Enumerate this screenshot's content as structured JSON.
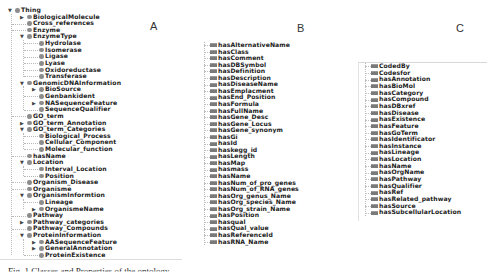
{
  "panel_labels": {
    "a": "A",
    "b": "B",
    "c": "C"
  },
  "class_tree": [
    {
      "label": "Thing",
      "depth": 0,
      "toggle": "expanded"
    },
    {
      "label": "BiologicalMolecule",
      "depth": 1,
      "toggle": "collapsed"
    },
    {
      "label": "Cross_references",
      "depth": 1,
      "toggle": "none"
    },
    {
      "label": "Enzyme",
      "depth": 1,
      "toggle": "none"
    },
    {
      "label": "EnzymeType",
      "depth": 1,
      "toggle": "expanded"
    },
    {
      "label": "Hydrolase",
      "depth": 2,
      "toggle": "none"
    },
    {
      "label": "Isomerase",
      "depth": 2,
      "toggle": "none"
    },
    {
      "label": "Ligase",
      "depth": 2,
      "toggle": "none"
    },
    {
      "label": "Lyase",
      "depth": 2,
      "toggle": "none"
    },
    {
      "label": "Oxidoreductase",
      "depth": 2,
      "toggle": "none"
    },
    {
      "label": "Transferase",
      "depth": 2,
      "toggle": "none"
    },
    {
      "label": "GenomicDNAInformation",
      "depth": 1,
      "toggle": "expanded"
    },
    {
      "label": "BioSource",
      "depth": 2,
      "toggle": "collapsed"
    },
    {
      "label": "Genbankident",
      "depth": 2,
      "toggle": "none"
    },
    {
      "label": "NASequenceFeature",
      "depth": 2,
      "toggle": "collapsed"
    },
    {
      "label": "SequenceQualifier",
      "depth": 2,
      "toggle": "none"
    },
    {
      "label": "GO_term",
      "depth": 1,
      "toggle": "none"
    },
    {
      "label": "GO_term_Annotation",
      "depth": 1,
      "toggle": "collapsed"
    },
    {
      "label": "GO_term_Categories",
      "depth": 1,
      "toggle": "expanded"
    },
    {
      "label": "Biological_Process",
      "depth": 2,
      "toggle": "none"
    },
    {
      "label": "Cellular_Component",
      "depth": 2,
      "toggle": "none"
    },
    {
      "label": "Molecular_function",
      "depth": 2,
      "toggle": "none"
    },
    {
      "label": "hasName",
      "depth": 1,
      "toggle": "none"
    },
    {
      "label": "Location",
      "depth": 1,
      "toggle": "expanded"
    },
    {
      "label": "Interval_Location",
      "depth": 2,
      "toggle": "none"
    },
    {
      "label": "Position",
      "depth": 2,
      "toggle": "none"
    },
    {
      "label": "Organism_Disease",
      "depth": 1,
      "toggle": "none"
    },
    {
      "label": "Organisme",
      "depth": 1,
      "toggle": "none"
    },
    {
      "label": "OrganismInformtion",
      "depth": 1,
      "toggle": "expanded"
    },
    {
      "label": "Lineage",
      "depth": 2,
      "toggle": "none"
    },
    {
      "label": "OrganismeName",
      "depth": 2,
      "toggle": "collapsed"
    },
    {
      "label": "Pathway",
      "depth": 1,
      "toggle": "none"
    },
    {
      "label": "Pathway_categories",
      "depth": 1,
      "toggle": "collapsed"
    },
    {
      "label": "Pathway_Compounds",
      "depth": 1,
      "toggle": "none"
    },
    {
      "label": "ProteinInformation",
      "depth": 1,
      "toggle": "expanded"
    },
    {
      "label": "AASequenceFeature",
      "depth": 2,
      "toggle": "collapsed"
    },
    {
      "label": "GeneralAnnotation",
      "depth": 2,
      "toggle": "collapsed"
    },
    {
      "label": "ProteinExistence",
      "depth": 2,
      "toggle": "none"
    }
  ],
  "data_properties": [
    "hasAlternativeName",
    "hasClass",
    "hasComment",
    "hasDBSymbol",
    "hasDefinition",
    "hasDescription",
    "hasDiseaseName",
    "hasEmplacment",
    "hasEnd_Position",
    "hasFormula",
    "hasFullName",
    "hasGene_Desc",
    "hasGene_Locus",
    "hasGene_synonym",
    "hasGi",
    "hasId",
    "haskegg_id",
    "hasLength",
    "hasMap",
    "hasmass",
    "hasName",
    "hasNum_of_pro_genes",
    "hasNum_of_RNA_genes",
    "hasOrg_genus_Name",
    "hasOrg_species_Name",
    "hasOrg_strain_Name",
    "hasPosition",
    "hasqual",
    "hasQual_value",
    "hasReferenceId",
    "hasRNA_Name"
  ],
  "object_properties": [
    "CodedBy",
    "Codesfor",
    "hasAnnotation",
    "hasBioMol",
    "hasCategory",
    "hasCompound",
    "hasDBxref",
    "hasDisease",
    "hasExistence",
    "hasFeature",
    "hasGoTerm",
    "hasIdentificator",
    "hasInstance",
    "hasLineage",
    "hasLocation",
    "hasName",
    "hasOrgName",
    "hasPathway",
    "hasQualifier",
    "hasRef",
    "hasRelated_pathway",
    "hasSource",
    "hasSubcellularLocation"
  ],
  "caption": "Fig. 1  Classes and Properties of the ontology"
}
